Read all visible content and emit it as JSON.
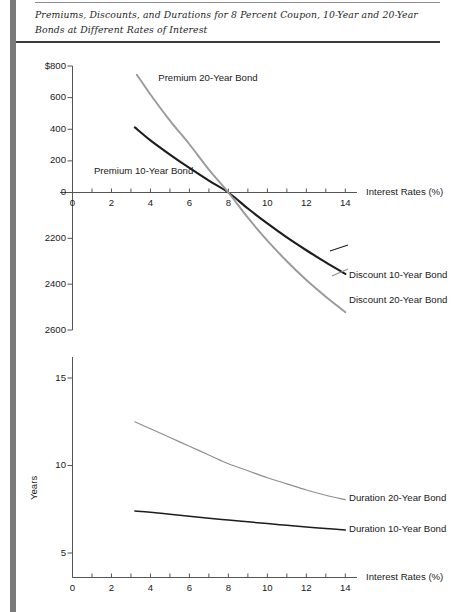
{
  "figure": {
    "title": "Premiums, Discounts, and Durations for 8 Percent Coupon, 10-Year and 20-Year Bonds at Different Rates of Interest"
  },
  "colors": {
    "curve_10yr": "#1d1d1d",
    "curve_20yr": "#9a9a9a",
    "axis": "#555555",
    "gutter": "#7a7a7a",
    "rule": "#3a3a3a"
  },
  "chart_data": [
    {
      "type": "line",
      "id": "premium-discount",
      "title": "",
      "xlabel": "Interest Rates (%)",
      "ylabel": "",
      "xlim": [
        0,
        14.6
      ],
      "ylim": [
        -600,
        800
      ],
      "grid": false,
      "legend": "inline-annotations",
      "xticks": [
        0,
        1,
        2,
        3,
        4,
        5,
        6,
        7,
        8,
        9,
        10,
        11,
        12,
        13,
        14
      ],
      "xticklabels": [
        "0",
        "",
        "2",
        "",
        "4",
        "",
        "6",
        "",
        "8",
        "",
        "10",
        "",
        "12",
        "",
        "14"
      ],
      "yticks": [
        800,
        600,
        400,
        200,
        0,
        -200,
        -400,
        -600
      ],
      "yticklabels": [
        "$800",
        "600",
        "400",
        "200",
        "0",
        "2200",
        "2400",
        "2600"
      ],
      "series": [
        {
          "name": "Premium 10-Year Bond",
          "label_discount": "Discount 10-Year Bond",
          "color": "#1d1d1d",
          "x": [
            3.2,
            4,
            5,
            6,
            7,
            8,
            9,
            10,
            11,
            12,
            13,
            14
          ],
          "y": [
            412,
            330,
            240,
            155,
            75,
            0,
            -70,
            -135,
            -196,
            -252,
            -305,
            -355
          ]
        },
        {
          "name": "Premium 20-Year Bond",
          "label_discount": "Discount 20-Year Bond",
          "color": "#9a9a9a",
          "x": [
            3.3,
            4,
            5,
            6,
            7,
            8,
            9,
            10,
            11,
            12,
            13,
            14
          ],
          "y": [
            745,
            620,
            455,
            305,
            145,
            0,
            -110,
            -210,
            -300,
            -382,
            -455,
            -522
          ]
        }
      ],
      "annotations": [
        {
          "text": "Premium 20-Year Bond",
          "x": 4.4,
          "y": 720
        },
        {
          "text": "Premium 10-Year Bond",
          "x": 1.1,
          "y": 130
        },
        {
          "text": "Discount 10-Year Bond",
          "x": 14.4,
          "y": -360
        },
        {
          "text": "Discount 20-Year Bond",
          "x": 14.4,
          "y": -470
        }
      ]
    },
    {
      "type": "line",
      "id": "duration",
      "title": "",
      "xlabel": "Interest Rates (%)",
      "ylabel": "Years",
      "xlim": [
        0,
        14.6
      ],
      "ylim": [
        3.6,
        16.2
      ],
      "grid": false,
      "legend": "inline-annotations",
      "xticks": [
        0,
        1,
        2,
        3,
        4,
        5,
        6,
        7,
        8,
        9,
        10,
        11,
        12,
        13,
        14
      ],
      "xticklabels": [
        "0",
        "",
        "2",
        "",
        "4",
        "",
        "6",
        "",
        "8",
        "",
        "10",
        "",
        "12",
        "",
        "14"
      ],
      "yticks": [
        15,
        10,
        5
      ],
      "yticklabels": [
        "15",
        "10",
        "5"
      ],
      "series": [
        {
          "name": "Duration 20-Year Bond",
          "color": "#8f8f8f",
          "x": [
            3.2,
            4,
            5,
            6,
            7,
            8,
            9,
            10,
            11,
            12,
            13,
            14
          ],
          "y": [
            12.5,
            12.1,
            11.6,
            11.1,
            10.6,
            10.1,
            9.7,
            9.3,
            8.95,
            8.6,
            8.3,
            8.05
          ]
        },
        {
          "name": "Duration 10-Year Bond",
          "color": "#1d1d1d",
          "x": [
            3.2,
            4,
            5,
            6,
            7,
            8,
            9,
            10,
            11,
            12,
            13,
            14
          ],
          "y": [
            7.4,
            7.33,
            7.22,
            7.1,
            6.99,
            6.88,
            6.78,
            6.68,
            6.58,
            6.49,
            6.4,
            6.32
          ]
        }
      ],
      "annotations": [
        {
          "text": "Duration 20-Year Bond",
          "x": 14.4,
          "y": 8.1
        },
        {
          "text": "Duration 10-Year Bond",
          "x": 14.4,
          "y": 6.35
        }
      ]
    }
  ]
}
